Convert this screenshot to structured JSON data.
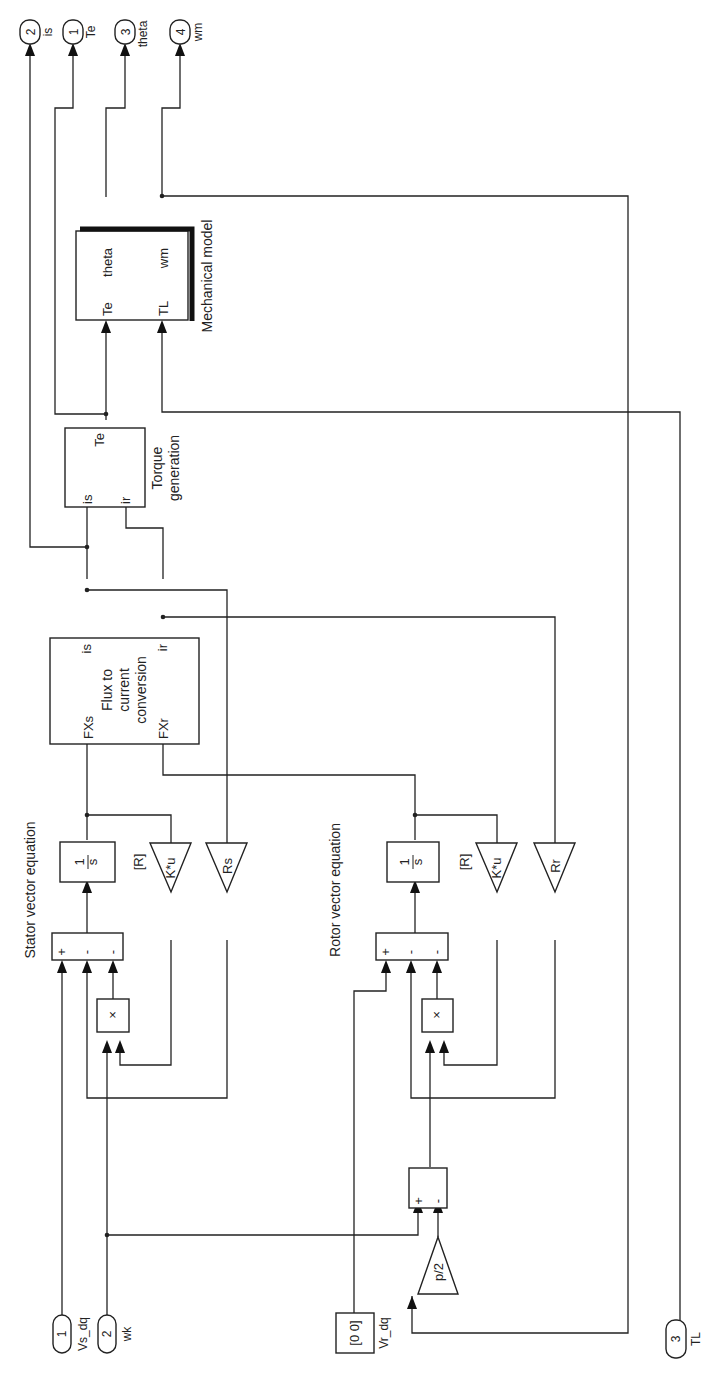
{
  "outports": [
    {
      "number": "2",
      "label": "is"
    },
    {
      "number": "1",
      "label": "Te"
    },
    {
      "number": "3",
      "label": "theta"
    },
    {
      "number": "4",
      "label": "wm"
    }
  ],
  "inports": [
    {
      "number": "1",
      "label": "Vs_dq"
    },
    {
      "number": "2",
      "label": "wk"
    },
    {
      "number": "3",
      "label": "TL"
    }
  ],
  "constant": {
    "value": "[0 0]",
    "label": "Vr_dq"
  },
  "mechanical_model": {
    "name": "Mechanical model",
    "in_ports": [
      "Te",
      "TL"
    ],
    "out_ports": [
      "theta",
      "wm"
    ]
  },
  "torque_generation": {
    "name_line1": "Torque",
    "name_line2": "generation",
    "in_ports": [
      "is",
      "ir"
    ],
    "out_ports": [
      "Te"
    ]
  },
  "flux_to_current": {
    "name_line1": "Flux to",
    "name_line2": "current",
    "name_line3": "conversion",
    "in_ports": [
      "FXs",
      "FXr"
    ],
    "out_ports": [
      "is",
      "ir"
    ]
  },
  "stator": {
    "title": "Stator vector equation",
    "integrator_num": "1",
    "integrator_den": "s",
    "sum_signs": [
      "+",
      "-",
      "-"
    ],
    "product": "×",
    "matrix_gain": "K*u",
    "matrix_gain_param": "[R]",
    "resistance_gain": "Rs"
  },
  "rotor": {
    "title": "Rotor vector equation",
    "integrator_num": "1",
    "integrator_den": "s",
    "sum_signs": [
      "+",
      "-",
      "-"
    ],
    "product": "×",
    "matrix_gain": "K*u",
    "matrix_gain_param": "[R]",
    "resistance_gain": "Rr"
  },
  "slip_sum": {
    "signs": [
      "+",
      "-"
    ]
  },
  "pole_gain": {
    "label": "p/2"
  }
}
